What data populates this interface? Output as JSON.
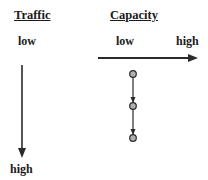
{
  "headers": {
    "traffic": "Traffic",
    "capacity": "Capacity"
  },
  "traffic_axis": {
    "low": "low",
    "high": "high"
  },
  "capacity_axis": {
    "low": "low",
    "high": "high"
  },
  "diagram": {
    "type": "axes-with-path",
    "traffic_direction": "down (low to high)",
    "capacity_direction": "right (low to high)",
    "path_nodes": 3,
    "colors": {
      "line": "#2a2a2a",
      "node_fill": "#b0b0b0"
    }
  }
}
